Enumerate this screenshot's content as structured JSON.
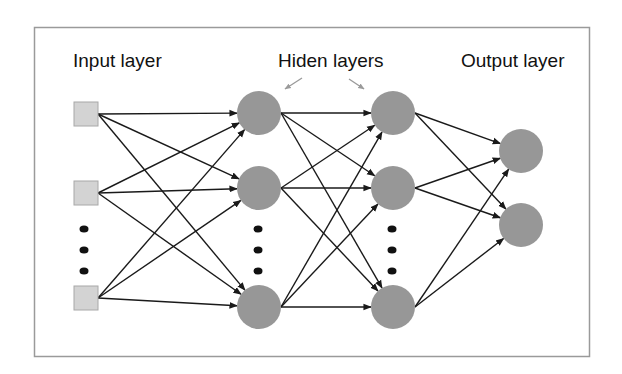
{
  "diagram": {
    "labels": {
      "input": "Input layer",
      "hidden": "Hiden layers",
      "output": "Output layer"
    },
    "colors": {
      "input_node_fill": "#d3d3d3",
      "input_node_stroke": "#a8a8a8",
      "node_fill": "#979797",
      "edge": "#1a1a1a",
      "arrow_hint": "#9a9a9a",
      "border": "#9a9a9a"
    },
    "layers": [
      {
        "name": "input",
        "shape": "square",
        "nodes": 3,
        "ellipsis": true
      },
      {
        "name": "hidden-1",
        "shape": "circle",
        "nodes": 3,
        "ellipsis": true
      },
      {
        "name": "hidden-2",
        "shape": "circle",
        "nodes": 3,
        "ellipsis": true
      },
      {
        "name": "output",
        "shape": "circle",
        "nodes": 2,
        "ellipsis": false
      }
    ]
  }
}
